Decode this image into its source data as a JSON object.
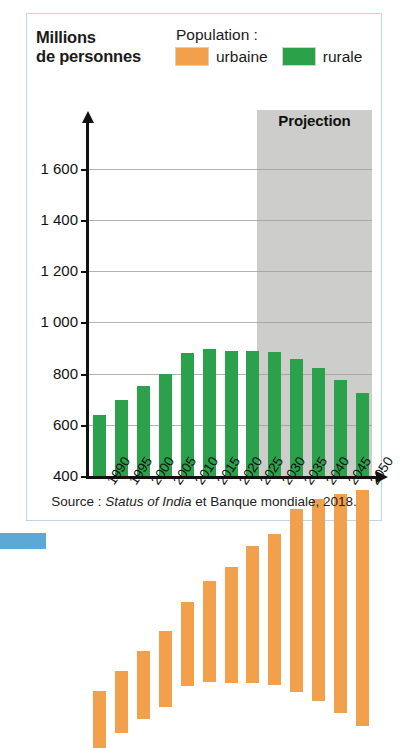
{
  "figure": {
    "axis_title_line1": "Millions",
    "axis_title_line2": "de personnes",
    "projection_label": "Projection",
    "source": "Source : ",
    "source_italic": "Status of India",
    "source_rest": " et Banque mondiale, 2018."
  },
  "legend": {
    "title": "Population :",
    "items": [
      {
        "label": "urbaine",
        "color": "#f2a04c",
        "key": "urbaine"
      },
      {
        "label": "rurale",
        "color": "#2ba14b",
        "key": "rurale"
      }
    ]
  },
  "chart_data": {
    "type": "bar",
    "stacked": true,
    "title": "Millions de personnes",
    "xlabel": "",
    "ylabel": "Millions de personnes",
    "ylim": [
      400,
      1700
    ],
    "yticks": [
      400,
      600,
      800,
      1000,
      1200,
      1400,
      1600
    ],
    "ytick_labels": [
      "400",
      "600",
      "800",
      "1 000",
      "1 200",
      "1 400",
      "1 600"
    ],
    "grid": true,
    "legend_position": "top",
    "categories": [
      "1990",
      "1995",
      "2000",
      "2005",
      "2010",
      "2015",
      "2020",
      "2025",
      "2030",
      "2035",
      "2040",
      "2045",
      "2050"
    ],
    "series": [
      {
        "name": "rurale",
        "color": "#2ba14b",
        "values": [
          640,
          695,
          750,
          800,
          880,
          895,
          890,
          890,
          885,
          855,
          820,
          775,
          725
        ]
      },
      {
        "name": "urbaine",
        "color": "#f2a04c",
        "values": [
          220,
          245,
          265,
          295,
          330,
          395,
          455,
          535,
          590,
          715,
          790,
          855,
          920
        ]
      }
    ],
    "totals": [
      860,
      940,
      1015,
      1095,
      1210,
      1290,
      1345,
      1425,
      1475,
      1570,
      1610,
      1630,
      1645
    ],
    "annotations": [
      {
        "text": "Projection",
        "from_category": "2020",
        "to_category": "2050"
      }
    ]
  }
}
